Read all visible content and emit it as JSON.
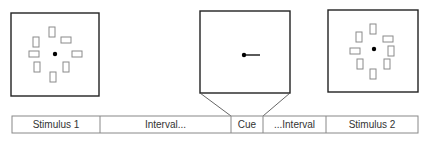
{
  "diagram": {
    "panels": [
      {
        "id": "stimulus-1",
        "box": {
          "x": 11,
          "y": 13,
          "w": 88,
          "h": 83
        },
        "fixation": {
          "cx": 55,
          "cy": 54,
          "r": 2.2
        },
        "items": [
          {
            "x": 49,
            "y": 27,
            "w": 6,
            "h": 10
          },
          {
            "x": 61,
            "y": 37,
            "w": 10,
            "h": 6
          },
          {
            "x": 33,
            "y": 37,
            "w": 6,
            "h": 10
          },
          {
            "x": 29,
            "y": 51,
            "w": 10,
            "h": 6
          },
          {
            "x": 72,
            "y": 51,
            "w": 10,
            "h": 6
          },
          {
            "x": 34,
            "y": 62,
            "w": 6,
            "h": 10
          },
          {
            "x": 63,
            "y": 62,
            "w": 6,
            "h": 10
          },
          {
            "x": 50,
            "y": 72,
            "w": 6,
            "h": 10
          }
        ]
      },
      {
        "id": "cue",
        "box": {
          "x": 200,
          "y": 11,
          "w": 90,
          "h": 82
        },
        "fixation": {
          "cx": 244,
          "cy": 55,
          "r": 2.2
        },
        "cue_line": {
          "x1": 246,
          "y1": 55,
          "x2": 260,
          "y2": 55
        }
      },
      {
        "id": "stimulus-2",
        "box": {
          "x": 328,
          "y": 10,
          "w": 90,
          "h": 82
        },
        "fixation": {
          "cx": 374,
          "cy": 49,
          "r": 2.2
        },
        "items": [
          {
            "x": 370,
            "y": 24,
            "w": 6,
            "h": 10
          },
          {
            "x": 383,
            "y": 36,
            "w": 10,
            "h": 6
          },
          {
            "x": 356,
            "y": 32,
            "w": 6,
            "h": 10
          },
          {
            "x": 350,
            "y": 48,
            "w": 10,
            "h": 6
          },
          {
            "x": 388,
            "y": 46,
            "w": 6,
            "h": 10
          },
          {
            "x": 357,
            "y": 59,
            "w": 6,
            "h": 10
          },
          {
            "x": 384,
            "y": 59,
            "w": 6,
            "h": 10
          },
          {
            "x": 370,
            "y": 69,
            "w": 6,
            "h": 10
          }
        ]
      }
    ],
    "timeline": {
      "y": 116,
      "h": 17,
      "x_start": 12,
      "x_end": 418,
      "segments": [
        {
          "label": "Stimulus 1",
          "x0": 12,
          "x1": 100
        },
        {
          "label": "Interval...",
          "x0": 100,
          "x1": 231
        },
        {
          "label": "Cue",
          "x0": 231,
          "x1": 263
        },
        {
          "label": "...Interval",
          "x0": 263,
          "x1": 326
        },
        {
          "label": "Stimulus 2",
          "x0": 326,
          "x1": 418
        }
      ]
    },
    "colors": {
      "box_stroke": "#222222",
      "item_stroke": "#8a8a8a",
      "timeline_stroke": "#888888",
      "text": "#333333"
    }
  }
}
